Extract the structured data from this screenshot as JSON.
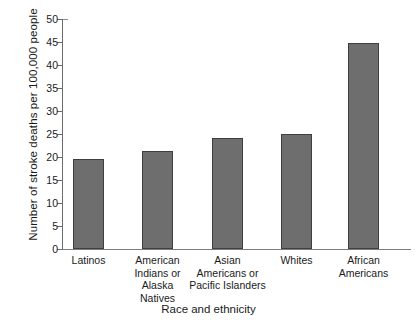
{
  "chart_data": {
    "type": "bar",
    "title": "",
    "xlabel": "Race and ethnicity",
    "ylabel": "Number of stroke deaths per 100,000 people",
    "categories": [
      "Latinos",
      "American\nIndians or\nAlaska\nNatives",
      "Asian\nAmericans or\nPacific Islanders",
      "Whites",
      "African\nAmericans"
    ],
    "values": [
      19.5,
      21.2,
      24.2,
      25.0,
      44.7
    ],
    "ylim": [
      0,
      50
    ],
    "yticks": [
      0,
      5,
      10,
      15,
      20,
      25,
      30,
      35,
      40,
      45,
      50
    ],
    "ytick_labels": [
      "0",
      "5",
      "10",
      "15",
      "20",
      "25",
      "30",
      "35",
      "40",
      "45",
      "50"
    ],
    "grid": false,
    "legend": false,
    "legend_position": "none",
    "bar_color": "#6e6e6e",
    "bar_edge_color": "#3f3f3f",
    "axis_color": "#6b6b6b",
    "background_color": "#ffffff"
  }
}
